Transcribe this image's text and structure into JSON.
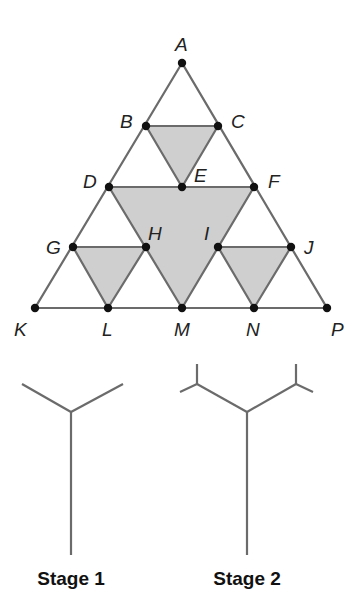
{
  "triangle": {
    "colors": {
      "line": "#6b6b6b",
      "shade": "#cfcfcf",
      "point": "#111111"
    },
    "points": {
      "A": [
        182,
        63
      ],
      "B": [
        146,
        126
      ],
      "C": [
        218,
        126
      ],
      "D": [
        109,
        187
      ],
      "E": [
        182,
        187
      ],
      "F": [
        254,
        187
      ],
      "G": [
        73,
        247
      ],
      "H": [
        146,
        247
      ],
      "I": [
        218,
        247
      ],
      "J": [
        291,
        247
      ],
      "K": [
        35,
        308
      ],
      "L": [
        108,
        308
      ],
      "M": [
        182,
        308
      ],
      "N": [
        254,
        308
      ],
      "P": [
        327,
        308
      ]
    },
    "labels": {
      "A": "A",
      "B": "B",
      "C": "C",
      "D": "D",
      "E": "E",
      "F": "F",
      "G": "G",
      "H": "H",
      "I": "I",
      "J": "J",
      "K": "K",
      "L": "L",
      "M": "M",
      "N": "N",
      "P": "P"
    },
    "shaded_triangles": [
      [
        "B",
        "C",
        "E"
      ],
      [
        "D",
        "F",
        "M"
      ],
      [
        "G",
        "H",
        "L"
      ],
      [
        "I",
        "J",
        "N"
      ]
    ]
  },
  "stages": [
    {
      "caption": "Stage 1"
    },
    {
      "caption": "Stage 2"
    }
  ]
}
